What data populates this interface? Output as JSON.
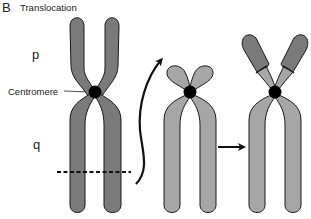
{
  "panel": {
    "letter": "B",
    "title": "Translocation"
  },
  "labels": {
    "p_arm": "p",
    "q_arm": "q",
    "centromere": "Centromere"
  },
  "colors": {
    "dark_chromosome": "#7a7a7a",
    "light_chromosome": "#a6a6a6",
    "outline": "#1a1a1a",
    "centromere": "#000000"
  },
  "elements": {
    "chromosomes": [
      {
        "id": "original-chromosome",
        "shade": "dark",
        "p_arm": "long",
        "break_point": "q-arm dashed line"
      },
      {
        "id": "recipient-chromosome",
        "shade": "light",
        "p_arm": "short"
      },
      {
        "id": "derivative-chromosome",
        "shade": "light with dark p-arm tips",
        "p_arm": "long (translocated segment)"
      }
    ],
    "arrows": [
      {
        "id": "curved-arrow",
        "from": "q-arm break of original chromosome",
        "to": "p-arm of recipient chromosome"
      },
      {
        "id": "straight-arrow",
        "from": "recipient chromosome",
        "to": "derivative chromosome"
      }
    ]
  }
}
